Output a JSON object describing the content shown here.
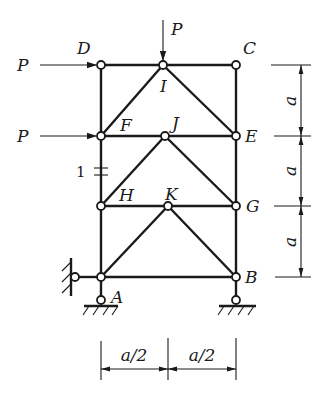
{
  "diagram": {
    "type": "truss",
    "nodes": {
      "D": {
        "label": "D"
      },
      "I": {
        "label": "I"
      },
      "C": {
        "label": "C"
      },
      "F": {
        "label": "F"
      },
      "J": {
        "label": "J"
      },
      "E": {
        "label": "E"
      },
      "H": {
        "label": "H"
      },
      "K": {
        "label": "K"
      },
      "G": {
        "label": "G"
      },
      "A": {
        "label": "A"
      },
      "B": {
        "label": "B"
      }
    },
    "loads": {
      "top": {
        "label": "P",
        "direction": "down",
        "at": "I"
      },
      "left_top": {
        "label": "P",
        "direction": "right",
        "at": "D"
      },
      "left_mid": {
        "label": "P",
        "direction": "right",
        "at": "F"
      }
    },
    "member_marker": {
      "label": "1",
      "member": "F-H"
    },
    "dimensions": {
      "vertical": [
        "a",
        "a",
        "a"
      ],
      "horizontal": [
        "a/2",
        "a/2"
      ]
    }
  }
}
